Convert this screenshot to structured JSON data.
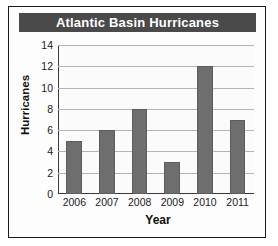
{
  "figure": {
    "title": "Atlantic Basin Hurricanes",
    "title_band_color": "#4a4a4a",
    "title_text_color": "#ffffff",
    "bar_color": "#6e6e6e",
    "gridline_color": "#b4b4b4",
    "axis_color": "#3a3a3a",
    "background_color": "#fbfbfb",
    "border_color": "#1a1a1a"
  },
  "chart_data": {
    "type": "bar",
    "title": "Atlantic Basin Hurricanes",
    "xlabel": "Year",
    "ylabel": "Hurricanes",
    "categories": [
      "2006",
      "2007",
      "2008",
      "2009",
      "2010",
      "2011"
    ],
    "values": [
      5,
      6,
      8,
      3,
      12,
      7
    ],
    "ylim": [
      0,
      14
    ],
    "ytick_labels": [
      "0",
      "2",
      "4",
      "6",
      "8",
      "10",
      "12",
      "14"
    ],
    "ytick_values": [
      0,
      2,
      4,
      6,
      8,
      10,
      12,
      14
    ],
    "grid": "horizontal",
    "legend": "none",
    "series": [
      {
        "name": "Hurricanes",
        "values": [
          5,
          6,
          8,
          3,
          12,
          7
        ]
      }
    ]
  }
}
